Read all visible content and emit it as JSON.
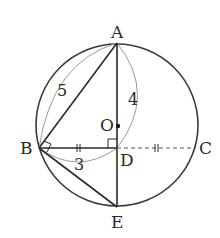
{
  "diagram": {
    "type": "geometry",
    "points": {
      "A": {
        "label": "A",
        "x": 117,
        "y": 43
      },
      "B": {
        "label": "B",
        "x": 39,
        "y": 148
      },
      "C": {
        "label": "C",
        "x": 196,
        "y": 148
      },
      "D": {
        "label": "D",
        "x": 117,
        "y": 148
      },
      "E": {
        "label": "E",
        "x": 117,
        "y": 207
      },
      "O": {
        "label": "O",
        "x": 117,
        "y": 125
      }
    },
    "circle": {
      "center": "O",
      "cx": 117,
      "cy": 125,
      "r": 82
    },
    "segments": [
      {
        "from": "A",
        "to": "B",
        "style": "solid"
      },
      {
        "from": "A",
        "to": "E",
        "style": "solid"
      },
      {
        "from": "B",
        "to": "D",
        "style": "solid"
      },
      {
        "from": "D",
        "to": "C",
        "style": "dashed"
      },
      {
        "from": "B",
        "to": "E",
        "style": "solid"
      }
    ],
    "measurements": {
      "AB": "5",
      "AD": "4",
      "BD": "3"
    },
    "marks": {
      "right_angle_at_D": true,
      "right_angle_at_B": true,
      "equal_ticks": [
        "BD",
        "DC"
      ]
    }
  }
}
